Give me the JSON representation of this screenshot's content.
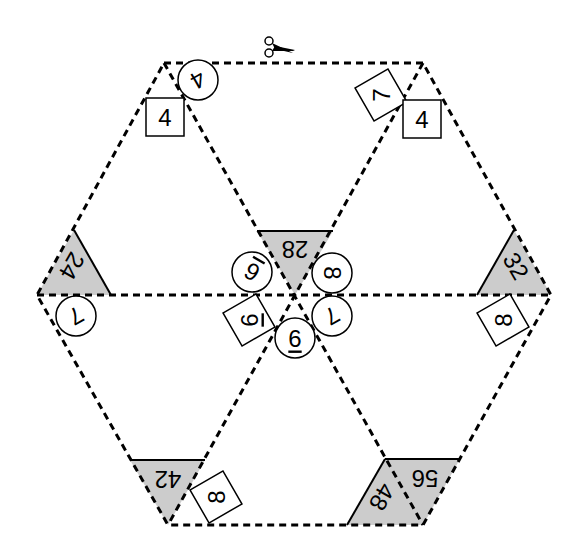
{
  "puzzle": {
    "type": "hexagon-tarsia-puzzle",
    "colors": {
      "line": "#000000",
      "shade": "#cccccc",
      "background": "#ffffff"
    },
    "cut_icon": "scissors-icon",
    "shaded_triangles": [
      {
        "id": "t28",
        "label": "28"
      },
      {
        "id": "t24",
        "label": "24"
      },
      {
        "id": "t32",
        "label": "32"
      },
      {
        "id": "t42",
        "label": "42"
      },
      {
        "id": "t48",
        "label": "48"
      },
      {
        "id": "t56",
        "label": "56"
      }
    ],
    "circle_labels": [
      {
        "id": "c-top-4",
        "label": "4"
      },
      {
        "id": "c-left-7",
        "label": "7"
      },
      {
        "id": "c-center-6a",
        "label": "6"
      },
      {
        "id": "c-center-8",
        "label": "8"
      },
      {
        "id": "c-center-7",
        "label": "7"
      },
      {
        "id": "c-center-6b",
        "label": "6"
      }
    ],
    "box_labels": [
      {
        "id": "b-topleft-4",
        "label": "4"
      },
      {
        "id": "b-topright-7",
        "label": "7"
      },
      {
        "id": "b-topright-4",
        "label": "4"
      },
      {
        "id": "b-center-6",
        "label": "6"
      },
      {
        "id": "b-right-8",
        "label": "8"
      },
      {
        "id": "b-bottom-8",
        "label": "8"
      }
    ]
  }
}
